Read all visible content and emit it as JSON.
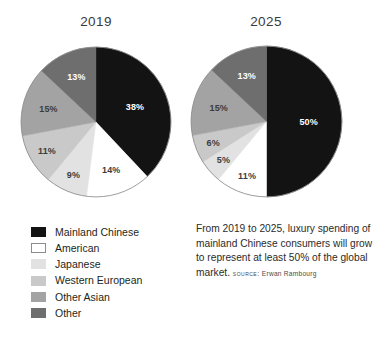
{
  "chart_data": [
    {
      "type": "pie",
      "title": "2019",
      "categories": [
        "Mainland Chinese",
        "American",
        "Japanese",
        "Western European",
        "Other Asian",
        "Other"
      ],
      "values": [
        38,
        14,
        9,
        11,
        15,
        13
      ],
      "labels": [
        "38%",
        "14%",
        "9%",
        "11%",
        "15%",
        "13%"
      ],
      "colors": [
        "#131313",
        "#ffffff",
        "#e2e2e2",
        "#c9c9c9",
        "#a3a3a3",
        "#6e6e6e"
      ],
      "start_angle_deg": 0,
      "direction": "clockwise",
      "units": "percent",
      "legend": "bottom-left"
    },
    {
      "type": "pie",
      "title": "2025",
      "categories": [
        "Mainland Chinese",
        "American",
        "Japanese",
        "Western European",
        "Other Asian",
        "Other"
      ],
      "values": [
        50,
        11,
        5,
        6,
        15,
        13
      ],
      "labels": [
        "50%",
        "11%",
        "5%",
        "6%",
        "15%",
        "13%"
      ],
      "colors": [
        "#131313",
        "#ffffff",
        "#e2e2e2",
        "#c9c9c9",
        "#a3a3a3",
        "#6e6e6e"
      ],
      "start_angle_deg": 0,
      "direction": "clockwise",
      "units": "percent",
      "legend": "bottom-left"
    }
  ],
  "charts": {
    "left": {
      "title": "2019",
      "slices": [
        {
          "label": "38%",
          "value": 38,
          "tone": "dark"
        },
        {
          "label": "14%",
          "value": 14,
          "tone": "light"
        },
        {
          "label": "9%",
          "value": 9,
          "tone": "light"
        },
        {
          "label": "11%",
          "value": 11,
          "tone": "light"
        },
        {
          "label": "15%",
          "value": 15,
          "tone": "light"
        },
        {
          "label": "13%",
          "value": 13,
          "tone": "dark"
        }
      ]
    },
    "right": {
      "title": "2025",
      "slices": [
        {
          "label": "50%",
          "value": 50,
          "tone": "dark"
        },
        {
          "label": "11%",
          "value": 11,
          "tone": "light"
        },
        {
          "label": "5%",
          "value": 5,
          "tone": "light"
        },
        {
          "label": "6%",
          "value": 6,
          "tone": "light"
        },
        {
          "label": "15%",
          "value": 15,
          "tone": "light"
        },
        {
          "label": "13%",
          "value": 13,
          "tone": "dark"
        }
      ]
    }
  },
  "legend": {
    "items": [
      {
        "label": "Mainland Chinese",
        "color": "#131313",
        "border": "#131313"
      },
      {
        "label": "American",
        "color": "#ffffff",
        "border": "#8c8c8c"
      },
      {
        "label": "Japanese",
        "color": "#e2e2e2",
        "border": "#e2e2e2"
      },
      {
        "label": "Western European",
        "color": "#c9c9c9",
        "border": "#c9c9c9"
      },
      {
        "label": "Other Asian",
        "color": "#a3a3a3",
        "border": "#a3a3a3"
      },
      {
        "label": "Other",
        "color": "#6e6e6e",
        "border": "#6e6e6e"
      }
    ]
  },
  "caption": {
    "text": "From 2019 to 2025, luxury spending of mainland Chinese consumers will grow to represent at least 50% of the global market.",
    "source_kicker": "SOURCE:",
    "source_name": "Erwan Rambourg"
  },
  "style": {
    "background": "#ffffff",
    "pie_outline": "#8c8c8c",
    "text_color": "#231f20"
  }
}
